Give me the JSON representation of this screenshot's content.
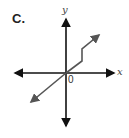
{
  "option_label": "C.",
  "axes": {
    "x_label": "x",
    "y_label": "y",
    "origin_label": "0"
  },
  "graph": {
    "description": "Line through origin rising to the right, with a vertical jump step in first quadrant, arrows on both ends",
    "colors": {
      "axis": "#111111",
      "line": "#555555"
    }
  }
}
